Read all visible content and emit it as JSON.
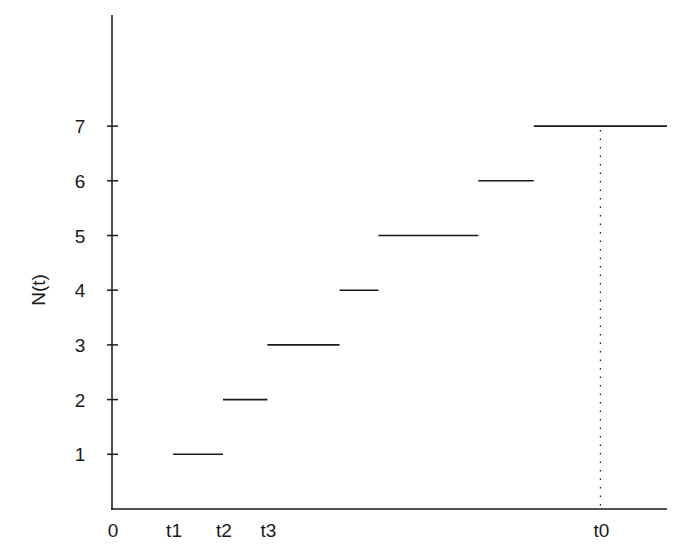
{
  "chart_data": {
    "type": "line",
    "subtype": "step-function",
    "title": "",
    "xlabel": "",
    "ylabel": "N(t)",
    "ylim": [
      0,
      8
    ],
    "yticks": [
      1,
      2,
      3,
      4,
      5,
      6,
      7
    ],
    "xtick_labels": [
      {
        "label": "0",
        "x": 0
      },
      {
        "label": "t1",
        "x": 1.1
      },
      {
        "label": "t2",
        "x": 2.0
      },
      {
        "label": "t3",
        "x": 2.8
      },
      {
        "label": "t0",
        "x": 8.8
      }
    ],
    "grid": false,
    "legend": null,
    "segments": [
      {
        "y": 1,
        "x_start": 1.1,
        "x_end": 2.0
      },
      {
        "y": 2,
        "x_start": 2.0,
        "x_end": 2.8
      },
      {
        "y": 3,
        "x_start": 2.8,
        "x_end": 4.1
      },
      {
        "y": 4,
        "x_start": 4.1,
        "x_end": 4.8
      },
      {
        "y": 5,
        "x_start": 4.8,
        "x_end": 6.6
      },
      {
        "y": 6,
        "x_start": 6.6,
        "x_end": 7.6
      },
      {
        "y": 7,
        "x_start": 7.6,
        "x_end": 10.0
      }
    ],
    "annotations": [
      {
        "type": "dotted-vertical-line",
        "x": 8.8,
        "from_y": 0,
        "to_y": 7,
        "label": "t0"
      }
    ]
  },
  "axes": {
    "ylabel": "N(t)",
    "y_tick_labels": [
      "1",
      "2",
      "3",
      "4",
      "5",
      "6",
      "7"
    ],
    "x_tick_labels": [
      "0",
      "t1",
      "t2",
      "t3",
      "t0"
    ]
  },
  "colors": {
    "ink": "#1a1a1a",
    "background": "#ffffff"
  }
}
